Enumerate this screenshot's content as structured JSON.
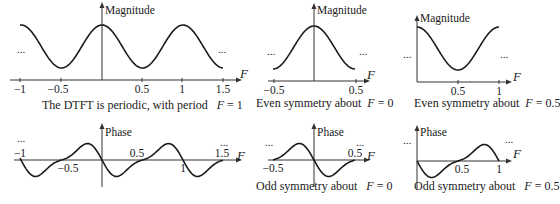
{
  "diagram": {
    "panels": [
      {
        "id": "mag-periodic",
        "ylabel": "Magnitude",
        "xlabel": "F",
        "ticks": [
          "−1",
          "−0.5",
          "0.5",
          "1",
          "1.5"
        ],
        "ellipsis_left": "...",
        "ellipsis_right": "...",
        "caption_text": "The DTFT is periodic, with period",
        "caption_var": "F",
        "caption_value": "= 1"
      },
      {
        "id": "mag-even-0",
        "ylabel": "Magnitude",
        "xlabel": "F",
        "ticks": [
          "−0.5",
          "0.5"
        ],
        "ellipsis_left": "...",
        "ellipsis_right": "...",
        "caption_text": "Even symmetry about",
        "caption_var": "F",
        "caption_value": "= 0"
      },
      {
        "id": "mag-even-05",
        "ylabel": "Magnitude",
        "xlabel": "F",
        "ticks": [
          "0.5",
          "1"
        ],
        "ellipsis_left": "...",
        "ellipsis_right": "...",
        "caption_text": "Even symmetry about",
        "caption_var": "F",
        "caption_value": "= 0.5"
      },
      {
        "id": "phase-periodic",
        "ylabel": "Phase",
        "xlabel": "F",
        "ticks": [
          "−1",
          "−0.5",
          "0.5",
          "1",
          "1.5"
        ],
        "ellipsis_left": "...",
        "ellipsis_right": "..."
      },
      {
        "id": "phase-odd-0",
        "ylabel": "Phase",
        "xlabel": "F",
        "ticks": [
          "−0.5",
          "0.5"
        ],
        "ellipsis_left": "...",
        "ellipsis_right": "...",
        "caption_text": "Odd symmetry about",
        "caption_var": "F",
        "caption_value": "= 0"
      },
      {
        "id": "phase-odd-05",
        "ylabel": "Phase",
        "xlabel": "F",
        "ticks": [
          "0.5",
          "1"
        ],
        "ellipsis_left": "...",
        "ellipsis_right": "...",
        "caption_text": "Odd symmetry about",
        "caption_var": "F",
        "caption_value": "= 0.5"
      }
    ],
    "colors": {
      "ink": "#1a1a1a",
      "axis": "#333333",
      "background": "#ffffff"
    }
  }
}
